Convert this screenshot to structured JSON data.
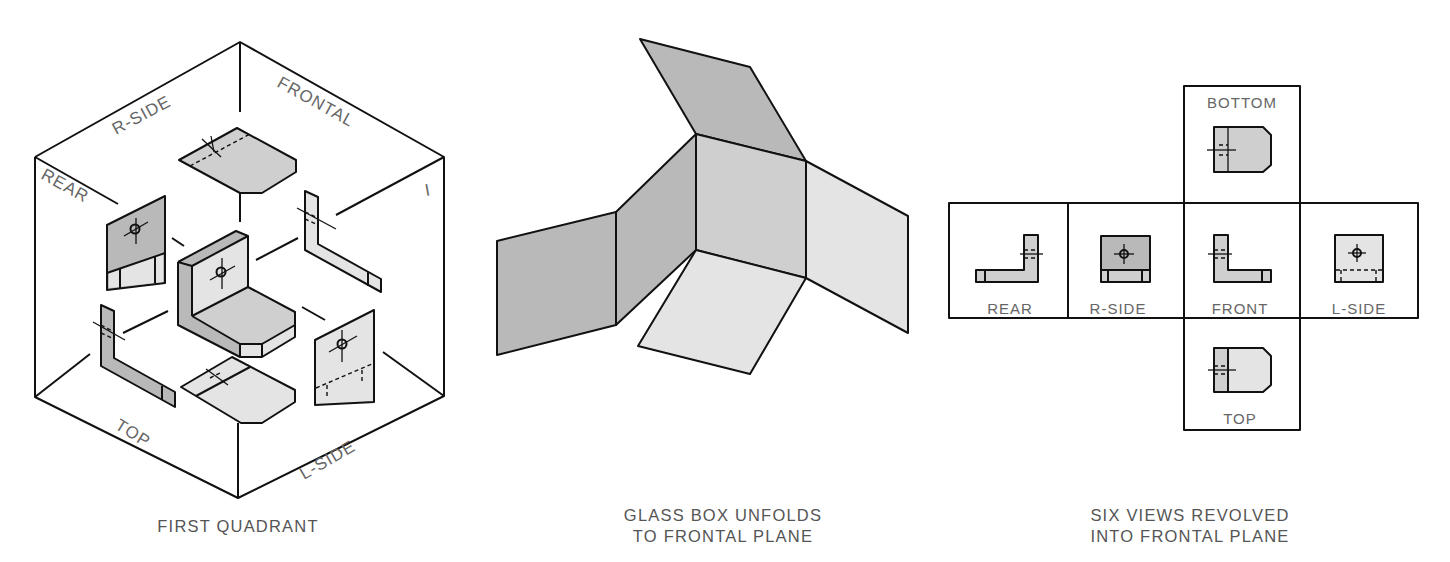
{
  "figure": {
    "panels": [
      {
        "id": "first-quadrant",
        "caption_lines": [
          "FIRST QUADRANT"
        ],
        "plane_labels": {
          "r_side": "R-SIDE",
          "frontal": "FRONTAL",
          "rear": "REAR",
          "quadrant": "I",
          "top": "TOP",
          "l_side": "L-SIDE"
        }
      },
      {
        "id": "glass-box-unfolds",
        "caption_lines": [
          "GLASS BOX UNFOLDS",
          "TO FRONTAL PLANE"
        ]
      },
      {
        "id": "six-views-revolved",
        "caption_lines": [
          "SIX VIEWS REVOLVED",
          "INTO FRONTAL PLANE"
        ],
        "view_labels": {
          "bottom": "BOTTOM",
          "rear": "REAR",
          "r_side": "R-SIDE",
          "front": "FRONT",
          "l_side": "L-SIDE",
          "top": "TOP"
        }
      }
    ],
    "colors": {
      "line": "#111111",
      "fill_dark": "#b9b9b9",
      "fill_medium": "#cfcfcf",
      "fill_light": "#e4e4e4",
      "label_text": "#666666"
    }
  }
}
